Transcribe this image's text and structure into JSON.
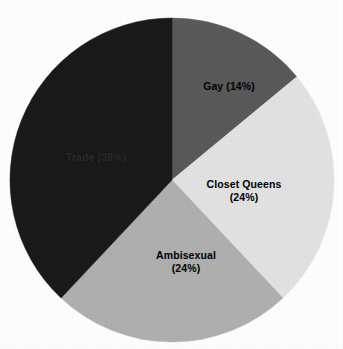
{
  "chart_data": {
    "type": "pie",
    "title": "",
    "subtitle": "",
    "xlabel": "",
    "ylabel": "",
    "legend": "none",
    "grid": false,
    "background_color": "#ffffff",
    "center": {
      "x": 172,
      "y": 180
    },
    "radius": 162,
    "start_angle_deg": 0,
    "direction": "clockwise",
    "categories": [
      "Gay",
      "Closet Queens",
      "Ambisexual",
      "Trade"
    ],
    "values": [
      14,
      24,
      24,
      38
    ],
    "value_unit": "percent",
    "total": 100,
    "slices": [
      {
        "name": "Gay",
        "value": 14,
        "percent_text": "(14%)",
        "label_lines": [
          "Gay (14%)"
        ],
        "color": "#5a5a5a",
        "start_angle_deg": 0,
        "end_angle_deg": 50.4,
        "label_x": 229,
        "label_y": 86
      },
      {
        "name": "Closet Queens",
        "value": 24,
        "percent_text": "(24%)",
        "label_lines": [
          "Closet Queens",
          "(24%)"
        ],
        "color": "#e3e3e3",
        "start_angle_deg": 50.4,
        "end_angle_deg": 136.8,
        "label_x": 244,
        "label_y": 190
      },
      {
        "name": "Ambisexual",
        "value": 24,
        "percent_text": "(24%)",
        "label_lines": [
          "Ambisexual",
          "(24%)"
        ],
        "color": "#b0b0b0",
        "start_angle_deg": 136.8,
        "end_angle_deg": 223.2,
        "label_x": 186,
        "label_y": 261
      },
      {
        "name": "Trade",
        "value": 38,
        "percent_text": "(38%)",
        "label_lines": [
          "Trade (38%)"
        ],
        "color": "#1a1a1a",
        "start_angle_deg": 223.2,
        "end_angle_deg": 360,
        "label_x": 96,
        "label_y": 157
      }
    ]
  }
}
